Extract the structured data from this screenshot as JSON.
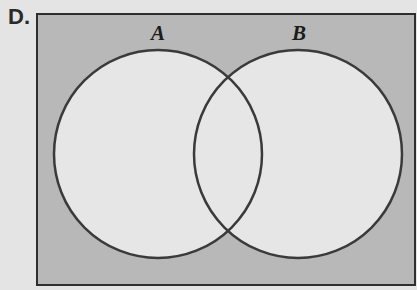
{
  "question": {
    "option_label": "D."
  },
  "venn": {
    "set_a_label": "A",
    "set_b_label": "B",
    "shaded_region": "universe outside A and B",
    "colors": {
      "page_background": "#e4e4e4",
      "shaded_fill": "#b8b8b8",
      "circle_fill": "#e6e6e6",
      "stroke": "#3a3a3a"
    }
  }
}
